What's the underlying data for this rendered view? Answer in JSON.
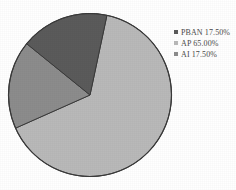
{
  "chart_data": {
    "type": "pie",
    "title": "",
    "categories": [
      "PBAN",
      "AP",
      "AI"
    ],
    "values": [
      17.5,
      65.0,
      17.5
    ],
    "value_suffix": "%",
    "legend_position": "right",
    "grid": false,
    "slice_colors": [
      "#5b5b5b",
      "#b9b9b9",
      "#8c8c8c"
    ],
    "outline_color": "#3a3a3a",
    "background": "#ffffff",
    "start_angle_deg": 12,
    "direction": "clockwise",
    "labels": [
      "PBAN 17.50%",
      "AP  65.00%",
      "AI  17.50%"
    ],
    "series": [
      {
        "name": "Composition",
        "points": [
          {
            "category": "PBAN",
            "value": 17.5,
            "label": "PBAN 17.50%",
            "color": "#5b5b5b"
          },
          {
            "category": "AP",
            "value": 65.0,
            "label": "AP  65.00%",
            "color": "#b9b9b9"
          },
          {
            "category": "AI",
            "value": 17.5,
            "label": "AI  17.50%",
            "color": "#8c8c8c"
          }
        ]
      }
    ]
  },
  "legend": {
    "items": [
      {
        "marker": "square-marker-dark",
        "text": "PBAN 17.50%"
      },
      {
        "marker": "square-marker-light",
        "text": "AP  65.00%"
      },
      {
        "marker": "square-marker-medium",
        "text": "AI  17.50%"
      }
    ]
  }
}
